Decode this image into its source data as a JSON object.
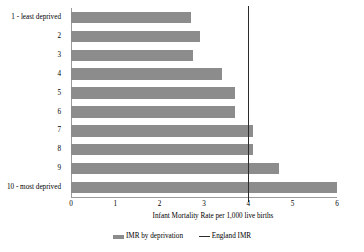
{
  "chart_data": {
    "type": "bar",
    "orientation": "horizontal",
    "title": "",
    "xlabel": "Infant Mortality Rate per 1,000 live births",
    "ylabel": "",
    "categories": [
      "1 - least deprived",
      "2",
      "3",
      "4",
      "5",
      "6",
      "7",
      "8",
      "9",
      "10 - most deprived"
    ],
    "values": [
      2.7,
      2.9,
      2.75,
      3.4,
      3.7,
      3.7,
      4.1,
      4.1,
      4.7,
      6.0
    ],
    "series": [
      {
        "name": "IMR by deprivation",
        "type": "bar",
        "color": "#8c8c8c",
        "values": [
          2.7,
          2.9,
          2.75,
          3.4,
          3.7,
          3.7,
          4.1,
          4.1,
          4.7,
          6.0
        ]
      },
      {
        "name": "England IMR",
        "type": "reference-line",
        "color": "#2b2b2b",
        "value": 4.0
      }
    ],
    "xlim": [
      0,
      6
    ],
    "xticks": [
      0,
      1,
      2,
      3,
      4,
      5,
      6
    ],
    "xtick_labels": [
      "0",
      "1",
      "2",
      "3",
      "4",
      "5",
      "6"
    ],
    "grid": false,
    "legend_position": "bottom"
  },
  "legend": {
    "bar_label": "IMR by deprivation",
    "line_label": "England IMR"
  },
  "axis": {
    "x_title": "Infant Mortality Rate per 1,000 live births"
  }
}
